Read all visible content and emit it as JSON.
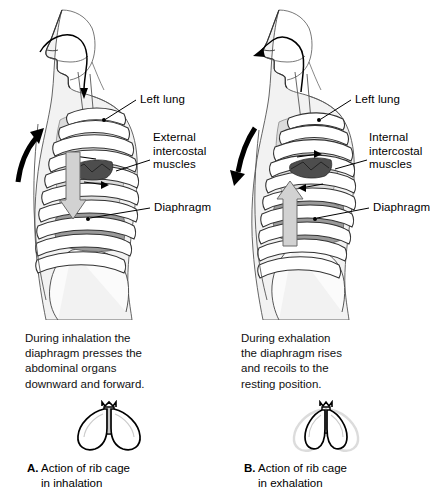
{
  "diagram": {
    "background_color": "#ffffff",
    "ink_color": "#000000",
    "body_fill": "#f2f2f2",
    "rib_fill": "#ffffff",
    "lung_fill": "#d8d8d8",
    "diaphragm_fill": "#9a9a9a",
    "muscle_fill": "#555555",
    "block_arrow_fill": "#d0d0d0",
    "ghost_outline": "#d9d9d9"
  },
  "panels": [
    {
      "id": "inhalation",
      "letter": "A.",
      "labels": [
        {
          "name": "left-lung",
          "text": "Left lung"
        },
        {
          "name": "intercostal-muscles",
          "text": "External\nintercostal\nmuscles"
        },
        {
          "name": "diaphragm",
          "text": "Diaphragm"
        }
      ],
      "caption": "During inhalation the\ndiaphragm presses the\nabdominal organs\ndownward and forward.",
      "figure_caption_line1": "Action of rib cage",
      "figure_caption_line2": "in inhalation",
      "airflow_direction": "in",
      "ribcage_arrow_direction": "up-and-out",
      "diaphragm_arrow_direction": "down"
    },
    {
      "id": "exhalation",
      "letter": "B.",
      "labels": [
        {
          "name": "left-lung",
          "text": "Left lung"
        },
        {
          "name": "intercostal-muscles",
          "text": "Internal\nintercostal\nmuscles"
        },
        {
          "name": "diaphragm",
          "text": "Diaphragm"
        }
      ],
      "caption": "During exhalation\nthe diaphragm rises\nand recoils to the\nresting position.",
      "figure_caption_line1": "Action of rib cage",
      "figure_caption_line2": "in exhalation",
      "airflow_direction": "out",
      "ribcage_arrow_direction": "down-and-in",
      "diaphragm_arrow_direction": "up"
    }
  ]
}
